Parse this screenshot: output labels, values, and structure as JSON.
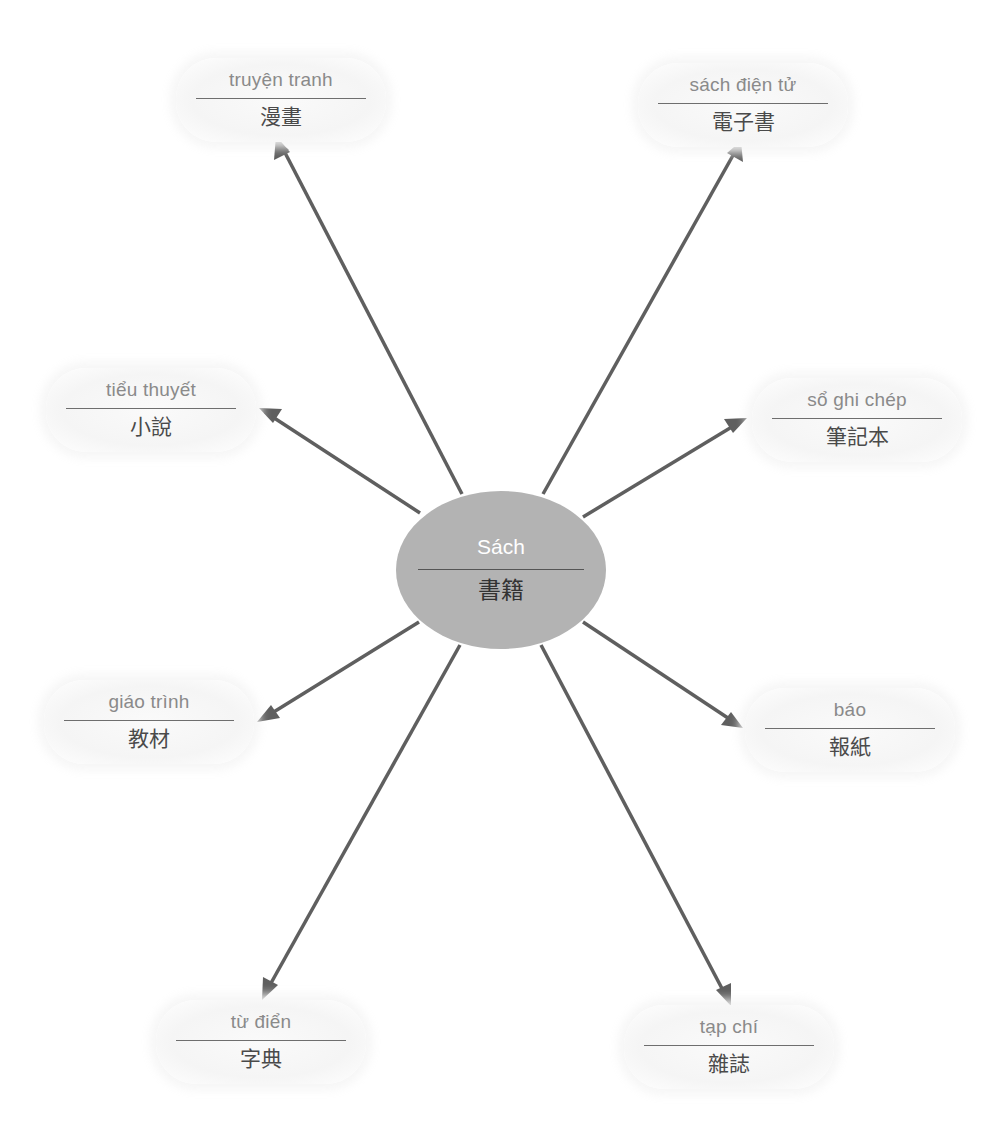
{
  "diagram": {
    "type": "mind-map",
    "colors": {
      "center_fill": "#b3b3b3",
      "arrow": "#5f5f5f",
      "node_fill": "#f5f5f5",
      "vietnamese_text": "#8a8a8a",
      "chinese_text": "#4a4a4a"
    },
    "center": {
      "vi": "Sách",
      "zh": "書籍"
    },
    "nodes": [
      {
        "id": "comic",
        "vi": "truyện tranh",
        "zh": "漫畫"
      },
      {
        "id": "ebook",
        "vi": "sách điện tử",
        "zh": "電子書"
      },
      {
        "id": "novel",
        "vi": "tiểu thuyết",
        "zh": "小說"
      },
      {
        "id": "notebook",
        "vi": "sổ ghi chép",
        "zh": "筆記本"
      },
      {
        "id": "textbook",
        "vi": "giáo trình",
        "zh": "教材"
      },
      {
        "id": "newspaper",
        "vi": "báo",
        "zh": "報紙"
      },
      {
        "id": "dictionary",
        "vi": "từ điển",
        "zh": "字典"
      },
      {
        "id": "magazine",
        "vi": "tạp chí",
        "zh": "雜誌"
      }
    ]
  }
}
